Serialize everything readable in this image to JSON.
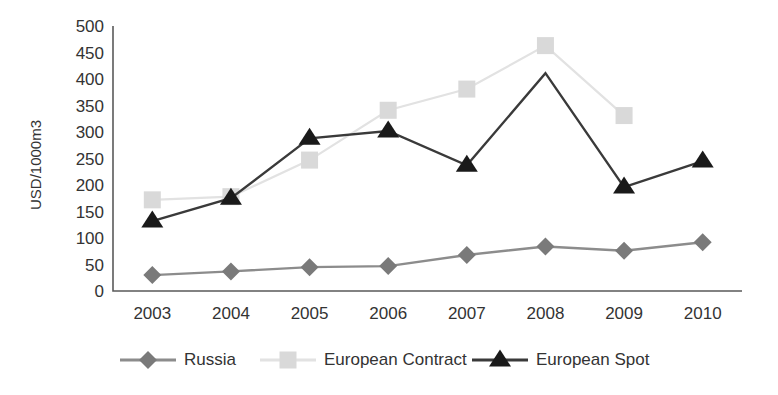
{
  "chart_data": {
    "type": "line",
    "title": "",
    "xlabel": "",
    "ylabel": "USD/1000m3",
    "categories": [
      "2003",
      "2004",
      "2005",
      "2006",
      "2007",
      "2008",
      "2009",
      "2010"
    ],
    "x": [
      2003,
      2004,
      2005,
      2006,
      2007,
      2008,
      2009,
      2010
    ],
    "ylim": [
      0,
      500
    ],
    "y_ticks": [
      0,
      50,
      100,
      150,
      200,
      250,
      300,
      350,
      400,
      450,
      500
    ],
    "y_tick_labels": [
      "0",
      "50",
      "100",
      "150",
      "200",
      "250",
      "300",
      "350",
      "400",
      "450",
      "500"
    ],
    "grid": false,
    "legend_position": "bottom",
    "series": [
      {
        "name": "Russia",
        "marker": "diamond",
        "color": "#7a7a7a",
        "line_color": "#8c8c8c",
        "values": [
          30,
          37,
          45,
          47,
          68,
          84,
          76,
          92
        ]
      },
      {
        "name": "European Contract",
        "marker": "square",
        "color": "#d9d9d9",
        "line_color": "#e2e2e2",
        "values": [
          172,
          178,
          247,
          341,
          381,
          463,
          331,
          null
        ]
      },
      {
        "name": "European Spot",
        "marker": "triangle",
        "color": "#1a1a1a",
        "line_color": "#3a3a3a",
        "values": [
          132,
          175,
          288,
          302,
          237,
          411,
          196,
          245
        ]
      }
    ]
  },
  "legend": {
    "items": [
      {
        "label": "Russia"
      },
      {
        "label": "European Contract"
      },
      {
        "label": "European Spot"
      }
    ]
  },
  "colors": {
    "axis": "#5a5a5a",
    "text": "#333333",
    "background": "#ffffff"
  }
}
